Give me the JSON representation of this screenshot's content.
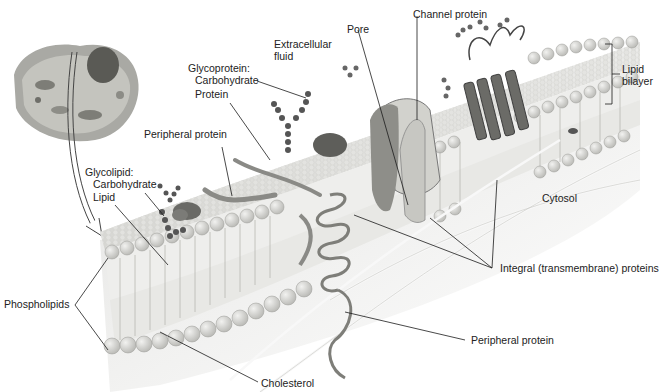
{
  "diagram": {
    "labels": {
      "extracellular_fluid": [
        "Extracellular",
        "fluid"
      ],
      "glycoprotein": "Glycoprotein:",
      "glycoprotein_carbohydrate": "Carbohydrate",
      "glycoprotein_protein": "Protein",
      "pore": "Pore",
      "channel_protein": "Channel protein",
      "lipid_bilayer": [
        "Lipid",
        "bilayer"
      ],
      "peripheral_protein_top": "Peripheral protein",
      "glycolipid": "Glycolipid:",
      "glycolipid_carbohydrate": "Carbohydrate",
      "glycolipid_lipid": "Lipid",
      "cytosol": "Cytosol",
      "integral_proteins": "Integral (transmembrane) proteins",
      "phospholipids": "Phospholipids",
      "peripheral_protein_bottom": "Peripheral protein",
      "cholesterol": "Cholesterol"
    },
    "colors": {
      "background": "#ffffff",
      "membrane_head": "#d9d9d6",
      "membrane_surface": "#e6e6e3",
      "protein": "#7a7a7a",
      "dark_protein": "#555555",
      "line": "#1a1a1a",
      "text": "#222222"
    }
  }
}
